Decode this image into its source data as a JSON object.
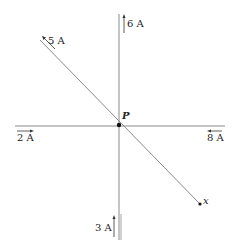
{
  "diagram": {
    "type": "wire-currents",
    "point_label": "P",
    "end_label": "x",
    "colors": {
      "wire": "#8a8a8a",
      "text": "#222222",
      "point": "#111111"
    },
    "wires": [
      {
        "id": "diagonal",
        "current": "5 A",
        "direction": "toward upper-left"
      },
      {
        "id": "vertical-top",
        "current": "6 A",
        "direction": "up"
      },
      {
        "id": "horizontal-left",
        "current": "2 A",
        "direction": "right"
      },
      {
        "id": "horizontal-right",
        "current": "8 A",
        "direction": "left"
      },
      {
        "id": "vertical-bottom",
        "current": "3 A",
        "direction": "up"
      }
    ]
  }
}
